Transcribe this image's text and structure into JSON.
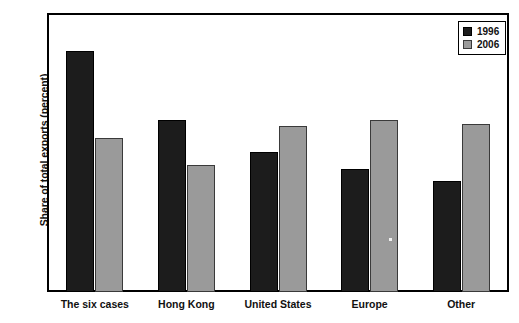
{
  "chart_data": {
    "type": "bar",
    "title": "",
    "xlabel": "",
    "ylabel": "Share of total exports (percent)",
    "categories": [
      "The six cases",
      "Hong Kong",
      "United States",
      "Europe",
      "Other"
    ],
    "series": [
      {
        "name": "1996",
        "color": "#1c1c1c",
        "values": [
          30.5,
          21.7,
          17.7,
          15.5,
          14.0
        ]
      },
      {
        "name": "2006",
        "color": "#9a9a9a",
        "values": [
          19.5,
          16.0,
          21.0,
          21.7,
          21.2
        ]
      }
    ],
    "ylim": [
      0,
      35
    ],
    "yticks": [
      0,
      5,
      10,
      15,
      20,
      25,
      30,
      35
    ],
    "ytick_labels": [
      "0",
      "5",
      "10",
      "15",
      "20",
      "25",
      "30",
      "35"
    ],
    "grid": false,
    "legend_position": "top-right",
    "legend_entries": [
      "1996",
      "2006"
    ],
    "annotations": []
  }
}
